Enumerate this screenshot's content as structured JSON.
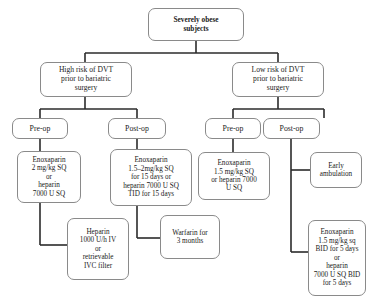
{
  "diagram": {
    "type": "flowchart",
    "nodes": {
      "root": "Severely obese\nsubjects",
      "high_risk": "High risk of DVT\nprior to bariatric\nsurgery",
      "low_risk": "Low risk of DVT\nprior to bariatric\nsurgery",
      "high_preop": "Pre-op",
      "high_postop": "Post-op",
      "low_preop": "Pre-op",
      "low_postop": "Post-op",
      "high_preop_tx": "Enoxaparin\n2 mg/kg SQ\nor\nheparin\n7000 U SQ",
      "high_preop_tx2": "Heparin\n1000 U/h IV\nor\nretrievable\nIVC filter",
      "high_postop_tx": "Enoxaparin\n1.5–2mg/kg SQ\nfor 15 days or\nheparin 7000 U SQ\nTID for 15 days",
      "high_postop_tx2": "Warfarin for\n3 months",
      "low_preop_tx": "Enoxaparin\n1.5 mg/kg SQ\nor heparin 7000\nU SQ",
      "low_postop_tx": "Early\nambulation",
      "low_postop_tx2": "Enoxaparin\n1.5 mg/kg sq\nBID for 5 days\nor\nheparin\n7000 U SQ BID\nfor 5 days"
    },
    "colors": {
      "node_border": "#8a8a8a",
      "connector": "#2b2b2b",
      "background": "#ffffff"
    }
  }
}
